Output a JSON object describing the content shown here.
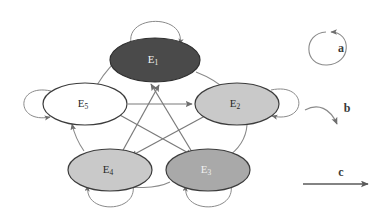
{
  "canvas": {
    "width": 389,
    "height": 217,
    "background": "#ffffff"
  },
  "diagram": {
    "type": "directed-graph-state-transition",
    "node_count": 5,
    "edge_stroke": "#6e6e6e",
    "node_stroke": "#3c3c3c",
    "nodes": [
      {
        "id": "E1",
        "label": "E",
        "subscript": "1",
        "fill": "#4a4a4a",
        "text_color": "#f2f2f2",
        "cx": 155,
        "cy": 60,
        "rx": 45,
        "ry": 22,
        "self_loop": "top"
      },
      {
        "id": "E2",
        "label": "E",
        "subscript": "2",
        "fill": "#c9c9c9",
        "text_color": "#2a2a2a",
        "cx": 237,
        "cy": 104,
        "rx": 42,
        "ry": 21,
        "self_loop": "right"
      },
      {
        "id": "E3",
        "label": "E",
        "subscript": "3",
        "fill": "#a9a9a9",
        "text_color": "#f0f0f0",
        "cx": 208,
        "cy": 170,
        "rx": 42,
        "ry": 21,
        "self_loop": "bottom"
      },
      {
        "id": "E4",
        "label": "E",
        "subscript": "4",
        "fill": "#c9c9c9",
        "text_color": "#2a2a2a",
        "cx": 110,
        "cy": 170,
        "rx": 42,
        "ry": 21,
        "self_loop": "bottom"
      },
      {
        "id": "E5",
        "label": "E",
        "subscript": "5",
        "fill": "#ffffff",
        "text_color": "#2a2a2a",
        "cx": 85,
        "cy": 104,
        "rx": 42,
        "ry": 21,
        "self_loop": "left"
      }
    ],
    "edges": [
      {
        "from": "E1",
        "to": "E2",
        "style": "b"
      },
      {
        "from": "E2",
        "to": "E3",
        "style": "b"
      },
      {
        "from": "E3",
        "to": "E4",
        "style": "b"
      },
      {
        "from": "E4",
        "to": "E5",
        "style": "b"
      },
      {
        "from": "E5",
        "to": "E1",
        "style": "b"
      },
      {
        "from": "E5",
        "to": "E2",
        "style": "c"
      },
      {
        "from": "E5",
        "to": "E3",
        "style": "c"
      },
      {
        "from": "E4",
        "to": "E1",
        "style": "c"
      },
      {
        "from": "E3",
        "to": "E1",
        "style": "c"
      },
      {
        "from": "E2",
        "to": "E4",
        "style": "c"
      }
    ],
    "self_loops": [
      {
        "node": "E1",
        "style": "a"
      },
      {
        "node": "E2",
        "style": "a"
      },
      {
        "node": "E3",
        "style": "a"
      },
      {
        "node": "E4",
        "style": "a"
      },
      {
        "node": "E5",
        "style": "a"
      }
    ]
  },
  "legend": {
    "items": [
      {
        "key": "a",
        "label": "a",
        "glyph": "self-loop-arrow",
        "cx": 340,
        "cy": 48
      },
      {
        "key": "b",
        "label": "b",
        "glyph": "curved-arrow",
        "cx": 340,
        "cy": 113
      },
      {
        "key": "c",
        "label": "c",
        "glyph": "straight-arrow",
        "cx": 340,
        "cy": 178
      }
    ]
  }
}
